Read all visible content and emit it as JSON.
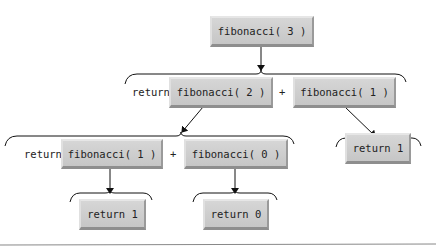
{
  "diagram": {
    "title": "",
    "nodes": {
      "root": "fibonacci( 3 )",
      "fib2": "fibonacci( 2 )",
      "fib1_top": "fibonacci( 1 )",
      "fib1_left": "fibonacci( 1 )",
      "fib0": "fibonacci( 0 )",
      "ret1_left": "return 1",
      "ret0": "return 0",
      "ret1_right": "return 1"
    },
    "labels": {
      "return_row2": "return",
      "plus_row2": "+",
      "return_row3": "return",
      "plus_row3": "+"
    },
    "edges": [
      {
        "from": "fibonacci( 3 )",
        "to": "return fibonacci( 2 ) + fibonacci( 1 )"
      },
      {
        "from": "fibonacci( 2 )",
        "to": "return fibonacci( 1 ) + fibonacci( 0 )"
      },
      {
        "from": "fibonacci( 1 )",
        "to": "return 1"
      },
      {
        "from": "fibonacci( 1 )",
        "to": "return 1"
      },
      {
        "from": "fibonacci( 0 )",
        "to": "return 0"
      }
    ]
  }
}
